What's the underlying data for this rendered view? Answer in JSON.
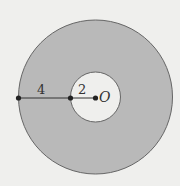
{
  "diagram": {
    "type": "annulus",
    "colors": {
      "background": "#efefed",
      "ring_fill": "#b9b9b9",
      "inner_fill": "#efefed",
      "stroke": "#555555",
      "point": "#222222"
    },
    "center_label": "O",
    "segment_outer_label": "4",
    "segment_inner_label": "2",
    "inner_radius": 2,
    "ring_width": 4,
    "outer_radius": 6
  }
}
